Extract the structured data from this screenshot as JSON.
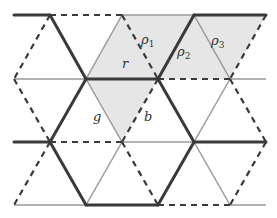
{
  "diagram": {
    "type": "triangular lattice edge coloring",
    "styles": {
      "thick": {
        "color": "#3a3a3a",
        "width": 3
      },
      "thin": {
        "color": "#9a9a9a",
        "width": 1.5
      },
      "dashed": {
        "color": "#3a3a3a",
        "width": 2.2,
        "dash": "6,5"
      }
    },
    "shade_color": "#e6e6e6",
    "labels": {
      "r": "r",
      "rho1": "ρ",
      "rho1_sub": "1",
      "rho2": "ρ",
      "rho2_sub": "2",
      "rho3": "ρ",
      "rho3_sub": "3",
      "g": "g",
      "b": "b"
    }
  }
}
